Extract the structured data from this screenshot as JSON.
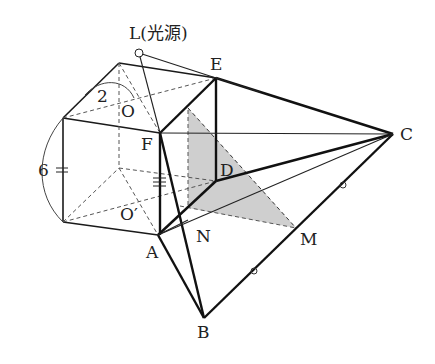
{
  "figure": {
    "type": "geometry-diagram",
    "labels": {
      "L": "L(光源)",
      "E": "E",
      "C": "C",
      "F": "F",
      "D": "D",
      "O": "O",
      "O_prime": "O′",
      "A": "A",
      "N": "N",
      "M": "M",
      "B": "B",
      "dim_height": "6",
      "dim_top": "2"
    },
    "points": {
      "L": [
        139,
        53
      ],
      "E": [
        216,
        78
      ],
      "C": [
        393,
        134
      ],
      "F": [
        160,
        133
      ],
      "D": [
        216,
        181
      ],
      "A": [
        158,
        235
      ],
      "N": [
        188,
        220
      ],
      "M": [
        296,
        228
      ],
      "B": [
        204,
        318
      ],
      "O": [
        139,
        102
      ],
      "O_prime": [
        139,
        168
      ]
    },
    "colors": {
      "line": "#1a1a1a",
      "shade": "#cfcfcf",
      "background": "#ffffff"
    }
  }
}
